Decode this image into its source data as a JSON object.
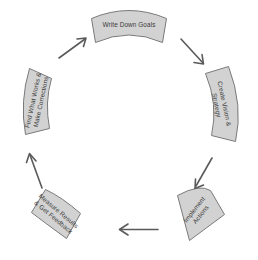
{
  "diagram": {
    "type": "cycle",
    "title": "",
    "background_color": "#ffffff",
    "block_fill": "#d2d2d2",
    "block_border": "#7a7a7a",
    "arrow_color": "#5a5a5a",
    "text_color": "#3b3b3b",
    "steps": [
      {
        "id": "write-down-goals",
        "position": "top",
        "lines": [
          "Write Down Goals"
        ],
        "line1": "Write Down Goals",
        "line2": ""
      },
      {
        "id": "create-vision-strategy",
        "position": "right",
        "lines": [
          "Create Vision &",
          "Strategy"
        ],
        "line1": "Create Vision &",
        "line2": "Strategy"
      },
      {
        "id": "implement-actions",
        "position": "bottom-right",
        "lines": [
          "Implement",
          "Actions"
        ],
        "line1": "Implement",
        "line2": "Actions"
      },
      {
        "id": "measure-results-get-feedback",
        "position": "bottom-left",
        "lines": [
          "Measure Results",
          "& Get Feedback"
        ],
        "line1": "Measure Results",
        "line2": "& Get Feedback"
      },
      {
        "id": "find-what-works-make-corrections",
        "position": "left",
        "lines": [
          "Find What Works &",
          "Make Corrections"
        ],
        "line1": "Find What Works &",
        "line2": "Make Corrections"
      }
    ],
    "arrows": [
      {
        "id": "arrow-top-right",
        "from": "write-down-goals",
        "to": "create-vision-strategy",
        "direction": "down-right"
      },
      {
        "id": "arrow-right-bottom",
        "from": "create-vision-strategy",
        "to": "implement-actions",
        "direction": "down-left"
      },
      {
        "id": "arrow-bottom",
        "from": "implement-actions",
        "to": "measure-results-get-feedback",
        "direction": "left"
      },
      {
        "id": "arrow-bottom-left",
        "from": "measure-results-get-feedback",
        "to": "find-what-works-make-corrections",
        "direction": "up-left"
      },
      {
        "id": "arrow-top-left",
        "from": "find-what-works-make-corrections",
        "to": "write-down-goals",
        "direction": "up-right"
      }
    ]
  }
}
